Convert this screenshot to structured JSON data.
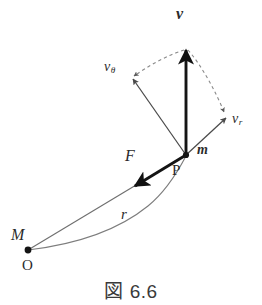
{
  "figure": {
    "caption": "図 6.6",
    "background_color": "#ffffff",
    "line_color": "#6b6b6b",
    "bold_line_color": "#1a1a1a",
    "text_color": "#2b2b2b"
  },
  "labels": {
    "velocity": "v",
    "velocity_tangential_base": "v",
    "velocity_tangential_sub": "θ",
    "velocity_radial_base": "v",
    "velocity_radial_sub": "r",
    "force": "F",
    "point_p": "P",
    "mass": "m",
    "radius": "r",
    "central_mass": "M",
    "origin": "O"
  },
  "geometry": {
    "point_p": [
      186,
      155
    ],
    "point_o": [
      28,
      250
    ],
    "velocity_tip": [
      186,
      47
    ],
    "velocity_tangential_tip": [
      131,
      78
    ],
    "velocity_radial_tip": [
      228,
      117
    ],
    "force_tip": [
      133,
      188
    ]
  }
}
